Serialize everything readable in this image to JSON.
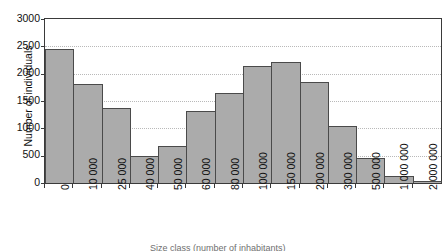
{
  "chart_data": {
    "type": "bar",
    "title": "",
    "subtitle": "",
    "xlabel": "Size class (number of inhabitants)",
    "ylabel": "Number of individuals",
    "ylim": [
      0,
      3000
    ],
    "ytick_step": 500,
    "yticks": [
      "3000",
      "2500",
      "2000",
      "1500",
      "1000",
      "500",
      "0"
    ],
    "ytick_values": [
      3000,
      2500,
      2000,
      1500,
      1000,
      500,
      0
    ],
    "grid": true,
    "grid_style": "dotted",
    "legend": "none",
    "bar_fill_color": "#ababab",
    "bar_edge_color": "#4a4a4a",
    "axis_color": "#3a3a3a",
    "gridline_color": "#b9b9b9",
    "categories": [
      "0",
      "10 000",
      "25 000",
      "40 000",
      "50 000",
      "60 000",
      "80 000",
      "100 000",
      "150 000",
      "200 000",
      "300 000",
      "500 000",
      "1 000 000",
      "2 000 000"
    ],
    "values": [
      2450,
      1820,
      1380,
      500,
      670,
      1310,
      1640,
      2140,
      2210,
      1840,
      1040,
      460,
      130,
      40
    ]
  }
}
